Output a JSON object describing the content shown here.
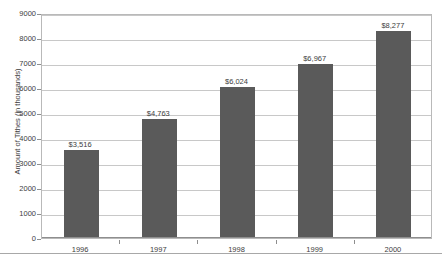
{
  "chart_data": {
    "type": "bar",
    "title": "",
    "xlabel": "",
    "ylabel": "Amount of Tithes (in thousands)",
    "categories": [
      "1996",
      "1997",
      "1998",
      "1999",
      "2000"
    ],
    "values": [
      3516,
      4763,
      6024,
      6967,
      8277
    ],
    "data_labels": [
      "$3,516",
      "$4,763",
      "$6,024",
      "$6,967",
      "$8,277"
    ],
    "ylim": [
      0,
      9000
    ],
    "ytick_values": [
      0,
      1000,
      2000,
      3000,
      4000,
      5000,
      6000,
      7000,
      8000,
      9000
    ],
    "ytick_labels": [
      "0",
      "1000",
      "2000",
      "3000",
      "4000",
      "5000",
      "6000",
      "7000",
      "8000",
      "9000"
    ],
    "grid": true,
    "legend": "none",
    "bar_color": "#5a5a5a",
    "gridline_color": "#c8c8c8",
    "axis_color": "#8e8e8e",
    "background_color": "#ffffff"
  }
}
